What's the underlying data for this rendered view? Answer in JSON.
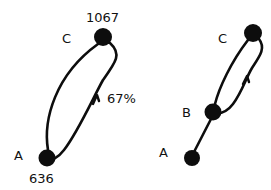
{
  "figure": {
    "title": "",
    "background_color": "#ffffff",
    "ink_color": "#0d0d0d"
  },
  "diagrams": [
    {
      "id": "left-diagram",
      "nodes": [
        {
          "id": "A",
          "label": "A",
          "value": "636",
          "cx": 47,
          "cy": 158,
          "r": 8.5,
          "label_x": 14,
          "label_y": 160,
          "value_x": 29,
          "value_y": 183
        },
        {
          "id": "C",
          "label": "C",
          "value": "1067",
          "cx": 103,
          "cy": 37,
          "r": 9.0,
          "label_x": 62,
          "label_y": 43,
          "value_x": 86,
          "value_y": 22
        }
      ],
      "edges": [
        {
          "id": "A-C-left",
          "from": "A",
          "to": "C",
          "label": "",
          "style": "curved"
        },
        {
          "id": "A-C-right",
          "from": "C",
          "to": "A",
          "label": "67%",
          "style": "curved-arrow",
          "label_x": 107,
          "label_y": 103
        }
      ]
    },
    {
      "id": "right-diagram",
      "nodes": [
        {
          "id": "A",
          "label": "A",
          "value": "",
          "cx": 192,
          "cy": 158,
          "r": 8.0,
          "label_x": 159,
          "label_y": 157,
          "value_x": 0,
          "value_y": 0
        },
        {
          "id": "B",
          "label": "B",
          "value": "",
          "cx": 213,
          "cy": 112,
          "r": 8.5,
          "label_x": 182,
          "label_y": 117,
          "value_x": 0,
          "value_y": 0
        },
        {
          "id": "C",
          "label": "C",
          "value": "",
          "cx": 253,
          "cy": 33,
          "r": 9.0,
          "label_x": 218,
          "label_y": 43,
          "value_x": 0,
          "value_y": 0
        }
      ],
      "edges": [
        {
          "id": "A-B",
          "from": "A",
          "to": "B",
          "label": "",
          "style": "straight"
        },
        {
          "id": "B-C-left",
          "from": "B",
          "to": "C",
          "label": "",
          "style": "curved"
        },
        {
          "id": "B-C-right",
          "from": "C",
          "to": "B",
          "label": "",
          "style": "curved-arrow"
        }
      ]
    }
  ]
}
